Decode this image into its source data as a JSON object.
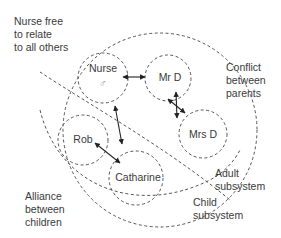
{
  "diagram": {
    "annotations": {
      "nurse_free": [
        "Nurse free",
        "to relate",
        "to all others"
      ],
      "conflict": [
        "Conflict",
        "between",
        "parents"
      ],
      "alliance": [
        "Alliance",
        "between",
        "children"
      ],
      "adult_subsystem": [
        "Adult",
        "subsystem"
      ],
      "child_subsystem": [
        "Child",
        "subsystem"
      ]
    },
    "nodes": {
      "nurse": {
        "label": "Nurse",
        "symbol": "♂"
      },
      "mr_d": {
        "label": "Mr D"
      },
      "mrs_d": {
        "label": "Mrs D"
      },
      "rob": {
        "label": "Rob"
      },
      "catharine": {
        "label": "Catharine"
      }
    },
    "relations": [
      {
        "from": "Nurse",
        "to": "Mr D",
        "type": "two-way"
      },
      {
        "from": "Mr D",
        "to": "Mrs D",
        "type": "conflict"
      },
      {
        "from": "Nurse",
        "to": "Catharine",
        "type": "two-way"
      },
      {
        "from": "Rob",
        "to": "Catharine",
        "type": "alliance"
      }
    ]
  }
}
